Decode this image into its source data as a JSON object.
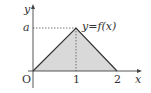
{
  "diagram": {
    "type": "function-graph",
    "function_label": "y=f(x)",
    "axis_labels": {
      "x": "x",
      "y": "y",
      "origin": "O"
    },
    "x_ticks": [
      "1",
      "2"
    ],
    "y_ticks": [
      "a"
    ],
    "vertices": [
      {
        "x": 0,
        "y": 0
      },
      {
        "x": 1,
        "y": "a"
      },
      {
        "x": 2,
        "y": 0
      }
    ],
    "colors": {
      "fill": "#d9d9d9",
      "line": "#333333",
      "axis": "#444444"
    }
  }
}
